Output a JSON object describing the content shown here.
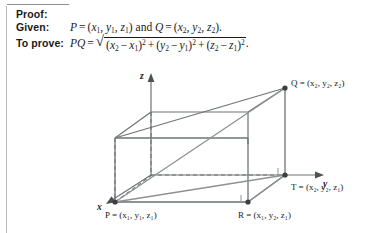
{
  "proof": {
    "heading": "Proof:",
    "given_label": "Given:",
    "prove_label": "To prove:"
  },
  "given": {
    "point_p": "P",
    "equals": "=",
    "p_coords_open": "(",
    "p_x": "x",
    "p_x_sub": "1",
    "p_y": "y",
    "p_y_sub": "1",
    "p_z": "z",
    "p_z_sub": "1",
    "conjunction": "and",
    "point_q": "Q",
    "q_x": "x",
    "q_x_sub": "2",
    "q_y": "y",
    "q_y_sub": "2",
    "q_z": "z",
    "q_z_sub": "2",
    "period": "."
  },
  "formula": {
    "lhs": "PQ",
    "equals": "=",
    "radical": "√",
    "term1_open": "(",
    "term1_a": "x",
    "term1_a_sub": "2",
    "term1_minus": "−",
    "term1_b": "x",
    "term1_b_sub": "1",
    "term1_close": ")",
    "term1_exp": "2",
    "plus1": "+",
    "term2_open": "(",
    "term2_a": "y",
    "term2_a_sub": "2",
    "term2_minus": "−",
    "term2_b": "y",
    "term2_b_sub": "1",
    "term2_close": ")",
    "term2_exp": "2",
    "plus2": "+",
    "term3_open": "(",
    "term3_a": "z",
    "term3_a_sub": "2",
    "term3_minus": "−",
    "term3_b": "z",
    "term3_b_sub": "1",
    "term3_close": ")",
    "term3_exp": "2",
    "period": "."
  },
  "diagram": {
    "axes": {
      "z": "z",
      "y": "y",
      "x": "x"
    },
    "vertices": {
      "q_label": "Q = (x₂, y₂, z₂)",
      "t_label": "T = (x₂, y₂, z₁)",
      "p_label": "P = (x₁, y₁, z₁)",
      "r_label": "R = (x₁, y₂, z₁)"
    },
    "colors": {
      "line": "#6e7376",
      "dashed": "#6e7376",
      "text": "#1a1a1a",
      "vertex_dot": "#3a3f42"
    }
  }
}
